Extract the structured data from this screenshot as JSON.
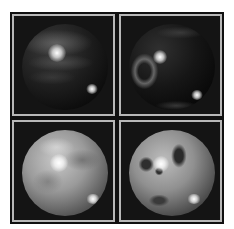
{
  "figure": {
    "layout": "2x2 grid",
    "panels": [
      {
        "id": "top-left",
        "description": "dark sphere with gray banding",
        "tone": "dark",
        "highlights": [
          {
            "x": 42,
            "y": 36,
            "r": 8
          },
          {
            "x": 76,
            "y": 74,
            "r": 6
          }
        ]
      },
      {
        "id": "top-right",
        "description": "dark sphere with ring feature",
        "tone": "dark",
        "highlights": [
          {
            "x": 32,
            "y": 33,
            "r": 7
          },
          {
            "x": 69,
            "y": 73,
            "r": 6
          }
        ]
      },
      {
        "id": "bottom-left",
        "description": "bright mottled sphere",
        "tone": "light",
        "highlights": [
          {
            "x": 38,
            "y": 33,
            "r": 8
          },
          {
            "x": 74,
            "y": 72,
            "r": 6
          }
        ]
      },
      {
        "id": "bottom-right",
        "description": "bright sphere with dark spots",
        "tone": "light",
        "highlights": [
          {
            "x": 32,
            "y": 33,
            "r": 7
          },
          {
            "x": 66,
            "y": 72,
            "r": 6
          }
        ]
      }
    ],
    "colors": {
      "background": "#ffffff",
      "frame": "#101010",
      "panel_border": "#b8b8b8"
    }
  }
}
